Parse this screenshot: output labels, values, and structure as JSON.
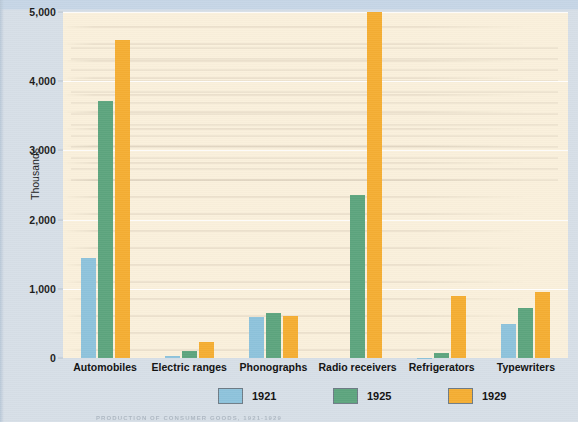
{
  "figure": {
    "background_color": "#d6dfe8",
    "plot_background_color": "#faf0dc",
    "caption": "PRODUCTION OF CONSUMER GOODS, 1921-1929"
  },
  "axis": {
    "y_label": "Thousands",
    "y_ticks": [
      "0",
      "1,000",
      "2,000",
      "3,000",
      "4,000",
      "5,000"
    ]
  },
  "legend": {
    "items": [
      {
        "label": "1921",
        "color": "#8ec3dc"
      },
      {
        "label": "1925",
        "color": "#5da57e"
      },
      {
        "label": "1929",
        "color": "#f5ae33"
      }
    ]
  },
  "chart_data": {
    "type": "bar",
    "title": "",
    "xlabel": "",
    "ylabel": "Thousands",
    "ylim": [
      0,
      5000
    ],
    "y_ticks": [
      0,
      1000,
      2000,
      3000,
      4000,
      5000
    ],
    "grid": true,
    "legend_position": "bottom",
    "categories": [
      "Automobiles",
      "Electric ranges",
      "Phonographs",
      "Radio receivers",
      "Refrigerators",
      "Typewriters"
    ],
    "series": [
      {
        "name": "1921",
        "color": "#8ec3dc",
        "values": [
          1450,
          30,
          595,
          0,
          5,
          490
        ]
      },
      {
        "name": "1925",
        "color": "#5da57e",
        "values": [
          3720,
          105,
          645,
          2350,
          75,
          725
        ]
      },
      {
        "name": "1929",
        "color": "#f5ae33",
        "values": [
          4600,
          230,
          600,
          5000,
          890,
          960
        ]
      }
    ]
  }
}
